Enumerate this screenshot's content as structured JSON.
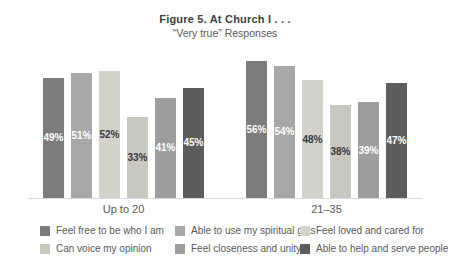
{
  "title": "Figure 5. At Church I . . .",
  "subtitle": "“Very true” Responses",
  "axis": {
    "baseline_color": "#d9d9d9"
  },
  "chart_data": {
    "type": "bar",
    "categories": [
      "Up to 20",
      "21–35"
    ],
    "ylim": [
      0,
      60
    ],
    "grid": false,
    "legend_position": "bottom",
    "unit": "%",
    "series": [
      {
        "name": "Feel free to be who I am",
        "color": "#7c7c7c",
        "label_color": "#ffffff",
        "values": [
          49,
          56
        ],
        "labels": [
          "49%",
          "56%"
        ]
      },
      {
        "name": "Able to use my spiritual gifts",
        "color": "#a7a7a7",
        "label_color": "#ffffff",
        "values": [
          51,
          54
        ],
        "labels": [
          "51%",
          "54%"
        ]
      },
      {
        "name": "Feel loved and cared for",
        "color": "#d3d3cc",
        "label_color": "#3a3a3a",
        "values": [
          52,
          48
        ],
        "labels": [
          "52%",
          "48%"
        ]
      },
      {
        "name": "Can voice my opinion",
        "color": "#c8c8c1",
        "label_color": "#3a3a3a",
        "values": [
          33,
          38
        ],
        "labels": [
          "33%",
          "38%"
        ]
      },
      {
        "name": "Feel closeness and unity",
        "color": "#9e9e9e",
        "label_color": "#ffffff",
        "values": [
          41,
          39
        ],
        "labels": [
          "41%",
          "39%"
        ]
      },
      {
        "name": "Able to help and serve people",
        "color": "#5d5d5d",
        "label_color": "#ffffff",
        "values": [
          45,
          47
        ],
        "labels": [
          "45%",
          "47%"
        ]
      }
    ]
  }
}
